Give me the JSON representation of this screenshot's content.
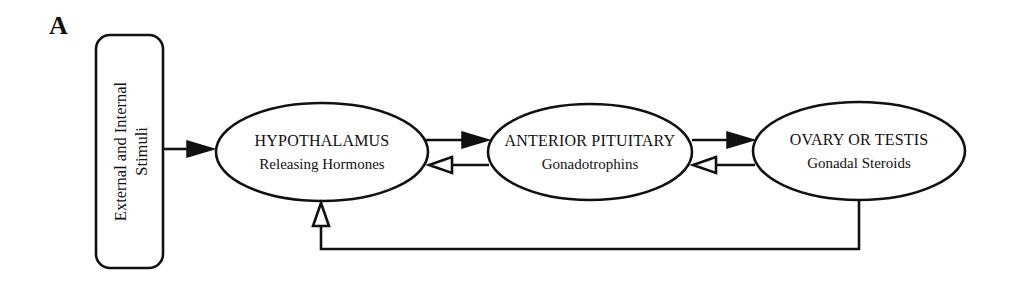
{
  "figure": {
    "panel_label": "A"
  },
  "stimuli_box": {
    "line1": "External and Internal",
    "line2": "Stimuli"
  },
  "nodes": [
    {
      "id": "hypothalamus",
      "title": "HYPOTHALAMUS",
      "subtitle": "Releasing Hormones"
    },
    {
      "id": "anterior-pituitary",
      "title": "ANTERIOR PITUITARY",
      "subtitle": "Gonadotrophins"
    },
    {
      "id": "ovary-or-testis",
      "title": "OVARY OR TESTIS",
      "subtitle": "Gonadal Steroids"
    }
  ],
  "edges": [
    {
      "from": "External and Internal Stimuli",
      "to": "HYPOTHALAMUS",
      "arrowhead": "filled"
    },
    {
      "from": "HYPOTHALAMUS",
      "to": "ANTERIOR PITUITARY",
      "arrowhead": "filled"
    },
    {
      "from": "ANTERIOR PITUITARY",
      "to": "HYPOTHALAMUS",
      "arrowhead": "open"
    },
    {
      "from": "ANTERIOR PITUITARY",
      "to": "OVARY OR TESTIS",
      "arrowhead": "filled"
    },
    {
      "from": "OVARY OR TESTIS",
      "to": "ANTERIOR PITUITARY",
      "arrowhead": "open"
    },
    {
      "from": "OVARY OR TESTIS",
      "to": "HYPOTHALAMUS",
      "arrowhead": "open"
    }
  ],
  "colors": {
    "ink": "#111111",
    "background": "#ffffff"
  }
}
